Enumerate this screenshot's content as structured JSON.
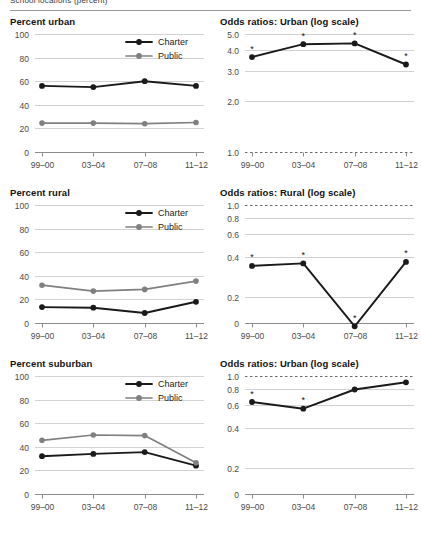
{
  "header": {
    "clipped_title": "School locations (percent)"
  },
  "legend": {
    "charter": "Charter",
    "public": "Public",
    "charter_color": "#1a1a1a",
    "public_color": "#808080"
  },
  "x_categories": [
    "99–00",
    "03–04",
    "07–08",
    "11–12"
  ],
  "significance_marker": "*",
  "chart_data": [
    {
      "id": "percent-urban",
      "type": "line",
      "title": "Percent urban",
      "xlabel": "",
      "ylabel": "",
      "categories": [
        "99–00",
        "03–04",
        "07–08",
        "11–12"
      ],
      "yticks": [
        0,
        20,
        40,
        60,
        80,
        100
      ],
      "ylim": [
        0,
        100
      ],
      "grid": true,
      "legend": "top-right",
      "series": [
        {
          "name": "Charter",
          "color": "#1a1a1a",
          "values": [
            56,
            55,
            60,
            56
          ]
        },
        {
          "name": "Public",
          "color": "#808080",
          "values": [
            24.5,
            24.5,
            24,
            25
          ]
        }
      ]
    },
    {
      "id": "odds-ratios-urban",
      "type": "line",
      "title": "Odds ratios: Urban (log scale)",
      "xlabel": "",
      "ylabel": "",
      "categories": [
        "99–00",
        "03–04",
        "07–08",
        "11–12"
      ],
      "yticks": [
        1.0,
        2.0,
        3.0,
        4.0,
        5.0
      ],
      "ytick_labels": [
        "1.0",
        "2.0",
        "3.0",
        "4.0",
        "5.0"
      ],
      "ylim": [
        1.0,
        5.0
      ],
      "log_scale": true,
      "reference_line": 1.0,
      "grid": true,
      "legend": "none",
      "series": [
        {
          "name": "Charter",
          "color": "#1a1a1a",
          "values": [
            3.65,
            4.35,
            4.4,
            3.3
          ],
          "significant": [
            true,
            true,
            true,
            true
          ]
        }
      ]
    },
    {
      "id": "percent-rural",
      "type": "line",
      "title": "Percent rural",
      "xlabel": "",
      "ylabel": "",
      "categories": [
        "99–00",
        "03–04",
        "07–08",
        "11–12"
      ],
      "yticks": [
        0,
        20,
        40,
        60,
        80,
        100
      ],
      "ylim": [
        0,
        100
      ],
      "grid": true,
      "legend": "top-right",
      "series": [
        {
          "name": "Charter",
          "color": "#1a1a1a",
          "values": [
            13.5,
            13,
            8.5,
            18
          ]
        },
        {
          "name": "Public",
          "color": "#808080",
          "values": [
            32,
            27,
            28.5,
            35.5
          ]
        }
      ]
    },
    {
      "id": "odds-ratios-rural",
      "type": "line",
      "title": "Odds ratios: Rural (log scale)",
      "xlabel": "",
      "ylabel": "",
      "categories": [
        "99–00",
        "03–04",
        "07–08",
        "11–12"
      ],
      "yticks": [
        0,
        0.2,
        0.4,
        0.6,
        0.8,
        1.0
      ],
      "ytick_labels": [
        "0",
        "0.2",
        "0.4",
        "0.6",
        "0.8",
        "1.0"
      ],
      "ylim": [
        0,
        1.0
      ],
      "log_scale": true,
      "reference_line": 1.0,
      "grid": true,
      "legend": "none",
      "series": [
        {
          "name": "Charter",
          "color": "#1a1a1a",
          "values": [
            0.345,
            0.36,
            0.12,
            0.37
          ],
          "significant": [
            true,
            true,
            true,
            true
          ]
        }
      ]
    },
    {
      "id": "percent-suburban",
      "type": "line",
      "title": "Percent suburban",
      "xlabel": "",
      "ylabel": "",
      "categories": [
        "99–00",
        "03–04",
        "07–08",
        "11–12"
      ],
      "yticks": [
        0,
        20,
        40,
        60,
        80,
        100
      ],
      "ylim": [
        0,
        100
      ],
      "grid": true,
      "legend": "top-right",
      "series": [
        {
          "name": "Charter",
          "color": "#1a1a1a",
          "values": [
            32,
            34,
            35.5,
            24
          ]
        },
        {
          "name": "Public",
          "color": "#808080",
          "values": [
            45.5,
            50,
            49.5,
            26.5
          ]
        }
      ]
    },
    {
      "id": "odds-ratios-suburban",
      "type": "line",
      "title": "Odds ratios: Urban (log scale)",
      "xlabel": "",
      "ylabel": "",
      "categories": [
        "99–00",
        "03–04",
        "07–08",
        "11–12"
      ],
      "yticks": [
        0,
        0.2,
        0.4,
        0.6,
        0.8,
        1.0
      ],
      "ytick_labels": [
        "0",
        "0.2",
        "0.4",
        "0.6",
        "0.8",
        "1.0"
      ],
      "ylim": [
        0,
        1.0
      ],
      "log_scale": true,
      "reference_line": 1.0,
      "grid": true,
      "legend": "none",
      "series": [
        {
          "name": "Charter",
          "color": "#1a1a1a",
          "values": [
            0.635,
            0.565,
            0.79,
            0.895
          ],
          "significant": [
            true,
            true,
            false,
            false
          ]
        }
      ]
    }
  ]
}
